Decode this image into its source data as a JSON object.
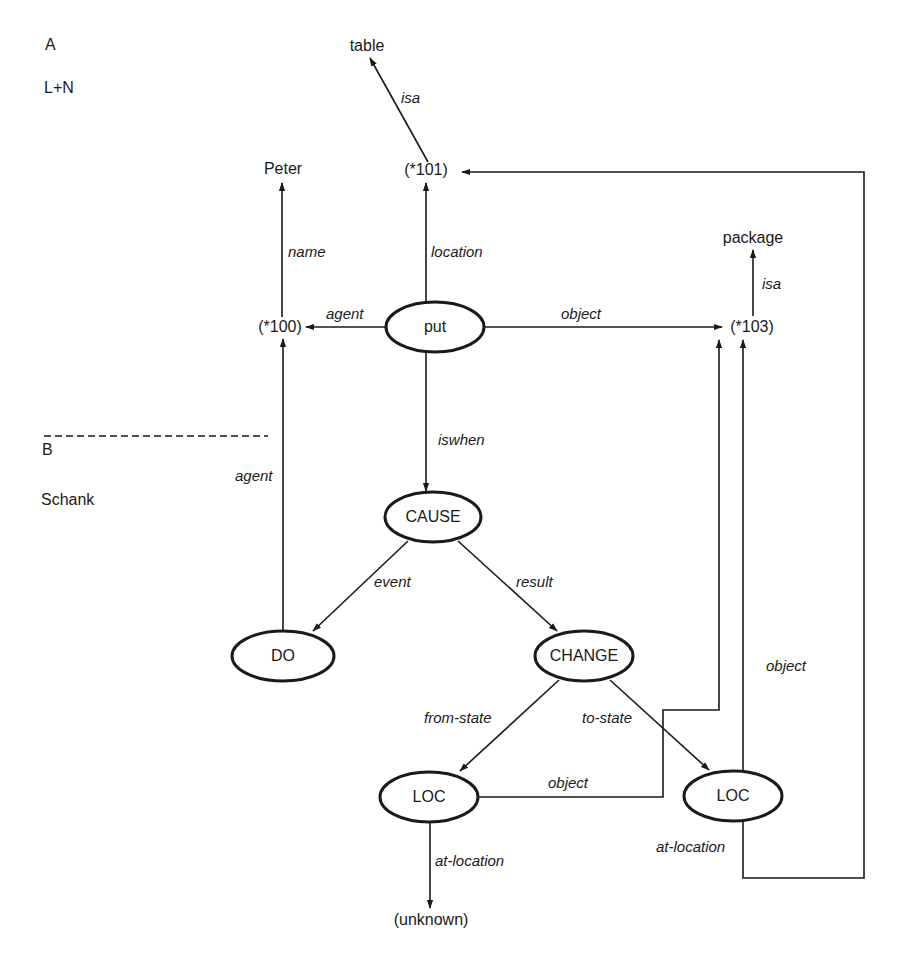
{
  "panel_labels": {
    "a_letter": "A",
    "a_name": "L+N",
    "b_letter": "B",
    "b_name": "Schank"
  },
  "nodes": {
    "table": "table",
    "peter": "Peter",
    "n101": "(*101)",
    "package": "package",
    "n100": "(*100)",
    "put": "put",
    "n103": "(*103)",
    "cause": "CAUSE",
    "do": "DO",
    "change": "CHANGE",
    "loc_from": "LOC",
    "loc_to": "LOC",
    "unknown": "(unknown)"
  },
  "edges": {
    "isa_table": "isa",
    "name": "name",
    "location": "location",
    "isa_package": "isa",
    "agent_top": "agent",
    "object_top": "object",
    "iswhen": "iswhen",
    "agent_do": "agent",
    "event": "event",
    "result": "result",
    "from_state": "from-state",
    "to_state": "to-state",
    "object_loc_from": "object",
    "object_loc_to": "object",
    "at_location_from": "at-location",
    "at_location_to": "at-location"
  }
}
